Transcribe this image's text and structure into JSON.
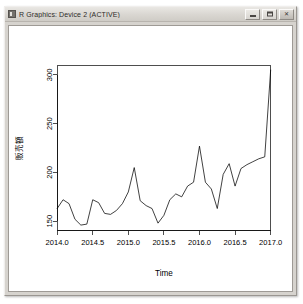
{
  "window": {
    "title": "R Graphics: Device 2 (ACTIVE)",
    "icon": "r-graphics-icon",
    "buttons": {
      "minimize": "minimize",
      "maximize": "maximize",
      "close": "close"
    }
  },
  "chart_data": {
    "type": "line",
    "title": "",
    "xlabel": "Time",
    "ylabel": "販売額",
    "xlim": [
      2014.0,
      2017.0
    ],
    "ylim": [
      140,
      310
    ],
    "xticks": [
      "2014.0",
      "2014.5",
      "2015.0",
      "2015.5",
      "2016.0",
      "2016.5",
      "2017.0"
    ],
    "xtick_values": [
      2014.0,
      2014.5,
      2015.0,
      2015.5,
      2016.0,
      2016.5,
      2017.0
    ],
    "yticks": [
      "150",
      "200",
      "250",
      "300"
    ],
    "ytick_values": [
      150,
      200,
      250,
      300
    ],
    "grid": false,
    "legend": "none",
    "line_color": "#000000",
    "series": [
      {
        "name": "販売額",
        "x": [
          2014.0,
          2014.083,
          2014.167,
          2014.25,
          2014.333,
          2014.417,
          2014.5,
          2014.583,
          2014.667,
          2014.75,
          2014.833,
          2014.917,
          2015.0,
          2015.083,
          2015.167,
          2015.25,
          2015.333,
          2015.417,
          2015.5,
          2015.583,
          2015.667,
          2015.75,
          2015.833,
          2015.917,
          2016.0,
          2016.083,
          2016.167,
          2016.25,
          2016.333,
          2016.417,
          2016.5,
          2016.583,
          2016.667,
          2016.75,
          2016.833,
          2016.917,
          2017.0
        ],
        "values": [
          163,
          172,
          168,
          152,
          146,
          147,
          172,
          169,
          158,
          157,
          161,
          168,
          180,
          205,
          171,
          166,
          163,
          148,
          156,
          172,
          178,
          175,
          186,
          190,
          227,
          190,
          183,
          163,
          198,
          209,
          186,
          204,
          208,
          211,
          214,
          216,
          305
        ]
      }
    ]
  }
}
